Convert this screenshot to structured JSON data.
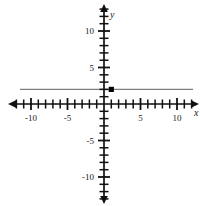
{
  "chart_data": {
    "type": "scatter",
    "title": "",
    "xlabel": "x",
    "ylabel": "y",
    "xlim": [
      -13,
      13
    ],
    "ylim": [
      -13.5,
      13.5
    ],
    "grid": false,
    "legend": null,
    "x_tick_labels": [
      "-10",
      "-5",
      "5",
      "10"
    ],
    "x_tick_values": [
      -10,
      -5,
      5,
      10
    ],
    "y_tick_labels": [
      "10",
      "5",
      "-5",
      "-10"
    ],
    "y_tick_values": [
      10,
      5,
      -5,
      -10
    ],
    "minor_tick_step": 1,
    "points": [
      {
        "label": "plotted-point",
        "x": 1,
        "y": 2,
        "color": "#000000"
      }
    ],
    "series": [
      {
        "name": "horizontal-line",
        "type": "line",
        "color": "#808080",
        "y_value": 2,
        "x_start": -11.5,
        "x_end": 12.2
      }
    ]
  },
  "axes": {
    "x_axis_name": "x-axis",
    "y_axis_name": "y-axis",
    "x_label_text": "x",
    "y_label_text": "y",
    "axis_color": "#111111"
  },
  "ticks": {
    "x_labeled": [
      {
        "text": "-10",
        "value": -10
      },
      {
        "text": "-5",
        "value": -5
      },
      {
        "text": "5",
        "value": 5
      },
      {
        "text": "10",
        "value": 10
      }
    ],
    "y_labeled": [
      {
        "text": "10",
        "value": 10
      },
      {
        "text": "5",
        "value": 5
      },
      {
        "text": "-5",
        "value": -5
      },
      {
        "text": "-10",
        "value": -10
      }
    ]
  }
}
